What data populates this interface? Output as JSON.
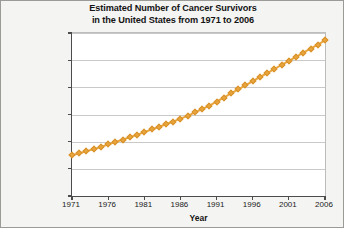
{
  "figure": {
    "background_color": "#f4f4f2",
    "plot_background_color": "#ffffff",
    "border_color": "#9a9a96"
  },
  "title": {
    "line1": "Estimated Number of Cancer Survivors",
    "line2": "in the United States from 1971 to 2006"
  },
  "axes": {
    "x_title": "Year",
    "y_title": "Number"
  },
  "chart_data": {
    "type": "line",
    "title": "Estimated Number of Cancer Survivors in the United States from 1971 to 2006",
    "xlabel": "Year",
    "ylabel": "Number",
    "xlim": [
      1971,
      2006
    ],
    "ylim": [
      0,
      12000000
    ],
    "grid": true,
    "legend": "none",
    "marker": "square",
    "marker_color": "#e8a53c",
    "line_color": "#e8a53c",
    "x_tick_labels": [
      "1971",
      "1976",
      "1981",
      "1986",
      "1991",
      "1996",
      "2001",
      "2006"
    ],
    "x_tick_values": [
      1971,
      1976,
      1981,
      1986,
      1991,
      1996,
      2001,
      2006
    ],
    "y_tick_labels": [
      "0",
      "2,000,000",
      "4,000,000",
      "6,000,000",
      "8,000,000",
      "10,000,000",
      "12,000,000"
    ],
    "y_tick_values": [
      0,
      2000000,
      4000000,
      6000000,
      8000000,
      10000000,
      12000000
    ],
    "x": [
      1971,
      1972,
      1973,
      1974,
      1975,
      1976,
      1977,
      1978,
      1979,
      1980,
      1981,
      1982,
      1983,
      1984,
      1985,
      1986,
      1987,
      1988,
      1989,
      1990,
      1991,
      1992,
      1993,
      1994,
      1995,
      1996,
      1997,
      1998,
      1999,
      2000,
      2001,
      2002,
      2003,
      2004,
      2005,
      2006
    ],
    "values": [
      3000000,
      3150000,
      3300000,
      3450000,
      3600000,
      3800000,
      3980000,
      4150000,
      4330000,
      4500000,
      4700000,
      4900000,
      5080000,
      5280000,
      5480000,
      5700000,
      5900000,
      6150000,
      6400000,
      6650000,
      6950000,
      7250000,
      7550000,
      7850000,
      8150000,
      8450000,
      8750000,
      9050000,
      9350000,
      9650000,
      9950000,
      10250000,
      10550000,
      10850000,
      11150000,
      11450000
    ]
  }
}
